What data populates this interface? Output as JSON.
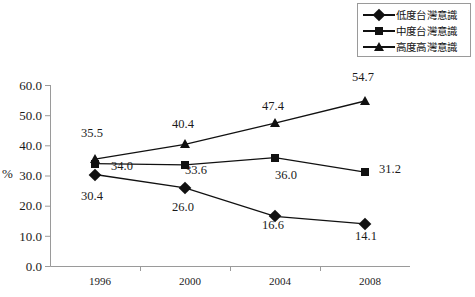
{
  "chart_data": {
    "type": "line",
    "title": "",
    "subtitle": "",
    "xlabel": "",
    "ylabel": "%",
    "categories": [
      "1996",
      "2000",
      "2004",
      "2008"
    ],
    "ylim": [
      0,
      60
    ],
    "ytick_step": 10,
    "yticks": [
      "0.0",
      "10.0",
      "20.0",
      "30.0",
      "40.0",
      "50.0",
      "60.0"
    ],
    "grid": false,
    "legend_position": "top-right",
    "series": [
      {
        "name": "低度台灣意識",
        "marker": "diamond",
        "color": "#111111",
        "values": [
          30.4,
          26.0,
          16.6,
          14.1
        ],
        "labels": [
          "30.4",
          "26.0",
          "16.6",
          "14.1"
        ]
      },
      {
        "name": "中度台灣意識",
        "marker": "square",
        "color": "#111111",
        "values": [
          34.0,
          33.6,
          36.0,
          31.2
        ],
        "labels": [
          "34.0",
          "33.6",
          "36.0",
          "31.2"
        ]
      },
      {
        "name": "高度高灣意識",
        "marker": "triangle",
        "color": "#111111",
        "values": [
          35.5,
          40.4,
          47.4,
          54.7
        ],
        "labels": [
          "35.5",
          "40.4",
          "47.4",
          "54.7"
        ]
      }
    ]
  },
  "legend": {
    "items": [
      {
        "label": "低度台灣意識",
        "marker": "diamond"
      },
      {
        "label": "中度台灣意識",
        "marker": "square"
      },
      {
        "label": "高度高灣意識",
        "marker": "triangle"
      }
    ]
  },
  "axis": {
    "unit": "%",
    "y_ticks": [
      "60.0",
      "50.0",
      "40.0",
      "30.0",
      "20.0",
      "10.0",
      "0.0"
    ],
    "x_ticks": [
      "1996",
      "2000",
      "2004",
      "2008"
    ]
  },
  "value_labels": {
    "low": [
      "30.4",
      "26.0",
      "16.6",
      "14.1"
    ],
    "mid": [
      "34.0",
      "33.6",
      "36.0",
      "31.2"
    ],
    "high": [
      "35.5",
      "40.4",
      "47.4",
      "54.7"
    ]
  },
  "colors": {
    "series": "#111111",
    "axis": "#9a9a9a",
    "text": "#1a1a1a",
    "background": "#ffffff"
  }
}
